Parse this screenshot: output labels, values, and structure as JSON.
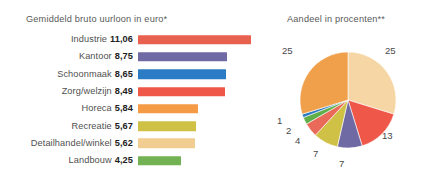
{
  "chart_data": [
    {
      "type": "bar",
      "title": "Gemiddeld bruto uurloon in euro*",
      "xlabel": "",
      "ylabel": "",
      "orientation": "horizontal",
      "grid": false,
      "legend": "none",
      "xlim": [
        0,
        12
      ],
      "categories": [
        "Industrie",
        "Kantoor",
        "Schoonmaak",
        "Zorg/welzijn",
        "Horeca",
        "Recreatie",
        "Detailhandel/winkel",
        "Landbouw"
      ],
      "values": [
        11.06,
        8.75,
        8.65,
        8.49,
        5.84,
        5.67,
        5.62,
        4.25
      ],
      "value_labels": [
        "11,06",
        "8,75",
        "8,65",
        "8,49",
        "5,84",
        "5,67",
        "5,62",
        "4,25"
      ],
      "colors": [
        "#e8604e",
        "#6f6aa3",
        "#2b7cc4",
        "#ef5849",
        "#f59a45",
        "#cfc046",
        "#f2cd91",
        "#72b252"
      ]
    },
    {
      "type": "pie",
      "title": "Aandeel in procenten**",
      "grid": false,
      "legend": "none",
      "labels": [
        "25",
        "13",
        "7",
        "7",
        "4",
        "2",
        "1",
        "25"
      ],
      "values": [
        25,
        13,
        7,
        7,
        4,
        2,
        1,
        25
      ],
      "colors": [
        "#f5d6a4",
        "#ef5849",
        "#6f6aa3",
        "#cfc046",
        "#ea6a5a",
        "#5fae49",
        "#2b7cc4",
        "#f0a04b"
      ],
      "start_angle_deg": 0,
      "direction": "clockwise"
    }
  ],
  "bar_chart": {
    "title": "Gemiddeld bruto uurloon in euro*",
    "rows": [
      {
        "category": "Industrie",
        "value_label": "11,06",
        "value": 11.06,
        "color": "#e8604e"
      },
      {
        "category": "Kantoor",
        "value_label": "8,75",
        "value": 8.75,
        "color": "#6f6aa3"
      },
      {
        "category": "Schoonmaak",
        "value_label": "8,65",
        "value": 8.65,
        "color": "#2b7cc4"
      },
      {
        "category": "Zorg/welzijn",
        "value_label": "8,49",
        "value": 8.49,
        "color": "#ef5849"
      },
      {
        "category": "Horeca",
        "value_label": "5,84",
        "value": 5.84,
        "color": "#f59a45"
      },
      {
        "category": "Recreatie",
        "value_label": "5,67",
        "value": 5.67,
        "color": "#cfc046"
      },
      {
        "category": "Detailhandel/winkel",
        "value_label": "5,62",
        "value": 5.62,
        "color": "#f2cd91"
      },
      {
        "category": "Landbouw",
        "value_label": "4,25",
        "value": 4.25,
        "color": "#72b252"
      }
    ]
  },
  "pie_chart": {
    "title": "Aandeel in procenten**",
    "slices": [
      {
        "label": "25",
        "value": 25,
        "color": "#f5d6a4"
      },
      {
        "label": "13",
        "value": 13,
        "color": "#ef5849"
      },
      {
        "label": "7",
        "value": 7,
        "color": "#6f6aa3"
      },
      {
        "label": "7",
        "value": 7,
        "color": "#cfc046"
      },
      {
        "label": "4",
        "value": 4,
        "color": "#ea6a5a"
      },
      {
        "label": "2",
        "value": 2,
        "color": "#5fae49"
      },
      {
        "label": "1",
        "value": 1,
        "color": "#2b7cc4"
      },
      {
        "label": "25",
        "value": 25,
        "color": "#f0a04b"
      }
    ],
    "label_positions": [
      {
        "label": "25",
        "x": 120,
        "y": 45
      },
      {
        "label": "13",
        "x": 117,
        "y": 130
      },
      {
        "label": "7",
        "x": 74,
        "y": 158
      },
      {
        "label": "7",
        "x": 48,
        "y": 148
      },
      {
        "label": "4",
        "x": 30,
        "y": 135
      },
      {
        "label": "2",
        "x": 21,
        "y": 125
      },
      {
        "label": "1",
        "x": 12,
        "y": 115
      },
      {
        "label": "25",
        "x": 17,
        "y": 45
      }
    ]
  }
}
